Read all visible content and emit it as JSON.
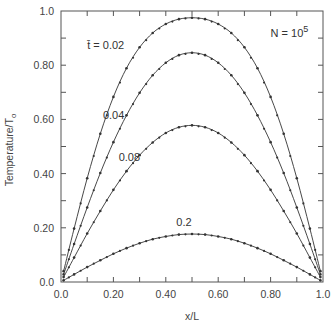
{
  "chart_data": {
    "type": "line",
    "title": "",
    "xlabel": "x/L",
    "ylabel": "Temperature/T",
    "ylabel_subscript": "o",
    "xlim": [
      0.0,
      1.0
    ],
    "ylim": [
      0.0,
      1.0
    ],
    "grid": false,
    "x_tick_labels": [
      "0.0",
      "0.20",
      "0.40",
      "0.60",
      "0.80",
      "1.0"
    ],
    "x_tick_values": [
      0.0,
      0.2,
      0.4,
      0.6,
      0.8,
      1.0
    ],
    "y_tick_labels": [
      "0.0",
      "0.20",
      "0.40",
      "0.60",
      "0.80",
      "1.0"
    ],
    "y_tick_values": [
      0.0,
      0.2,
      0.4,
      0.6,
      0.8,
      1.0
    ],
    "minor_tick_step": 0.1,
    "x": [
      0.01,
      0.05,
      0.1,
      0.15,
      0.2,
      0.25,
      0.3,
      0.35,
      0.4,
      0.45,
      0.5,
      0.55,
      0.6,
      0.65,
      0.7,
      0.75,
      0.8,
      0.85,
      0.9,
      0.95,
      0.99
    ],
    "series": [
      {
        "name": "t=0.02",
        "label": "t̄ = 0.02",
        "values": [
          0.04,
          0.197,
          0.383,
          0.547,
          0.683,
          0.789,
          0.866,
          0.919,
          0.952,
          0.97,
          0.975,
          0.97,
          0.952,
          0.919,
          0.866,
          0.789,
          0.683,
          0.547,
          0.383,
          0.197,
          0.04
        ]
      },
      {
        "name": "t=0.04",
        "label": "0.04",
        "values": [
          0.028,
          0.14,
          0.275,
          0.402,
          0.516,
          0.615,
          0.698,
          0.763,
          0.809,
          0.837,
          0.846,
          0.837,
          0.809,
          0.763,
          0.698,
          0.615,
          0.516,
          0.402,
          0.275,
          0.14,
          0.028
        ]
      },
      {
        "name": "t=0.08",
        "label": "0.08",
        "values": [
          0.018,
          0.09,
          0.179,
          0.262,
          0.34,
          0.409,
          0.468,
          0.515,
          0.55,
          0.571,
          0.578,
          0.571,
          0.55,
          0.515,
          0.468,
          0.409,
          0.34,
          0.262,
          0.179,
          0.09,
          0.018
        ]
      },
      {
        "name": "t=0.2",
        "label": "0.2",
        "values": [
          0.006,
          0.028,
          0.055,
          0.08,
          0.104,
          0.125,
          0.143,
          0.158,
          0.168,
          0.175,
          0.177,
          0.175,
          0.168,
          0.158,
          0.143,
          0.125,
          0.104,
          0.08,
          0.055,
          0.028,
          0.006
        ]
      }
    ],
    "annotations": [
      {
        "text": "t̄ = 0.02",
        "x": 0.1,
        "y": 0.86
      },
      {
        "text": "0.04",
        "x": 0.16,
        "y": 0.6
      },
      {
        "text": "0.08",
        "x": 0.22,
        "y": 0.445
      },
      {
        "text": "0.2",
        "x": 0.44,
        "y": 0.205
      },
      {
        "text": "N = 10",
        "superscript": "5",
        "x": 0.8,
        "y": 0.905
      }
    ],
    "marker": "small dot",
    "line_color": "#333333"
  }
}
